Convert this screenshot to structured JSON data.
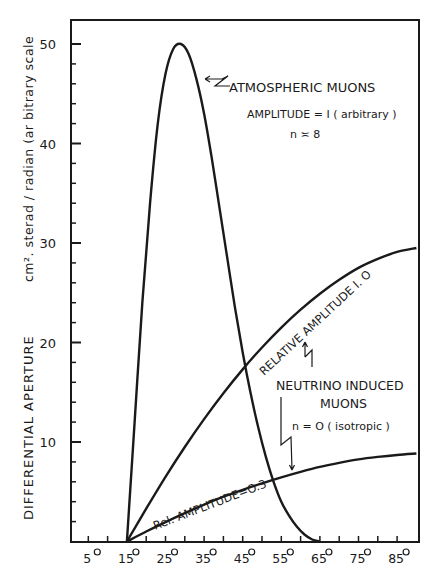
{
  "chart_data": {
    "type": "line",
    "title": "",
    "xlabel": "",
    "ylabel": "DIFFERENTIAL APERTURE   cm². sterad / radian (arbitrary scale",
    "ylabel_main": "DIFFERENTIAL  APERTURE",
    "ylabel_units": "cm². sterad / radian (arbitrary scale",
    "xlim": [
      0,
      90
    ],
    "ylim": [
      0,
      52
    ],
    "grid": false,
    "x_ticks": [
      5,
      15,
      25,
      35,
      45,
      55,
      65,
      75,
      85
    ],
    "x_tick_labels": [
      "5°",
      "15°",
      "25°",
      "35°",
      "45°",
      "55°",
      "65°",
      "75°",
      "85°"
    ],
    "y_ticks": [
      10,
      20,
      30,
      40,
      50
    ],
    "y_tick_labels": [
      "10",
      "20",
      "30",
      "40",
      "50"
    ],
    "series": [
      {
        "name": "Atmospheric muons (amplitude = 1, n ≈ 8)",
        "x": [
          15,
          17,
          19,
          21,
          23,
          25,
          27,
          29,
          31,
          33,
          35,
          37,
          39,
          41,
          43,
          45,
          47,
          49,
          51,
          53,
          55,
          57,
          59,
          61,
          63,
          65
        ],
        "y": [
          0,
          12,
          24,
          34,
          42,
          47,
          49.5,
          50,
          49,
          46.5,
          43,
          38.5,
          33.5,
          28.5,
          23.5,
          19,
          15,
          11.5,
          8.5,
          6,
          4,
          2.6,
          1.5,
          0.7,
          0.2,
          0
        ]
      },
      {
        "name": "Neutrino induced muons, relative amplitude 1.0 (n = 0, isotropic)",
        "x": [
          15,
          20,
          25,
          30,
          35,
          40,
          45,
          50,
          55,
          60,
          65,
          70,
          75,
          80,
          85,
          90
        ],
        "y": [
          0,
          3.3,
          6.5,
          9.5,
          12.3,
          14.9,
          17.3,
          19.5,
          21.5,
          23.3,
          24.9,
          26.3,
          27.5,
          28.4,
          29.1,
          29.5
        ]
      },
      {
        "name": "Neutrino induced muons, relative amplitude 0.3",
        "x": [
          15,
          20,
          25,
          30,
          35,
          40,
          45,
          50,
          55,
          60,
          65,
          70,
          75,
          80,
          85,
          90
        ],
        "y": [
          0,
          1.0,
          1.95,
          2.85,
          3.7,
          4.5,
          5.2,
          5.85,
          6.45,
          7.0,
          7.5,
          7.9,
          8.25,
          8.5,
          8.7,
          8.85
        ]
      }
    ],
    "annotations": [
      {
        "text": "ATMOSPHERIC MUONS",
        "target": "Atmospheric muons peak"
      },
      {
        "text": "AMPLITUDE = 1 (arbitrary)"
      },
      {
        "text": "n ≈ 8"
      },
      {
        "text": "RELATIVE AMPLITUDE 1.0"
      },
      {
        "text": "NEUTRINO INDUCED"
      },
      {
        "text": "MUONS"
      },
      {
        "text": "n = O (isotropic)"
      },
      {
        "text": "Rel. AMPLITUDE=0.3"
      }
    ]
  },
  "labels": {
    "atm_title": "ATMOSPHERIC  MUONS",
    "atm_amp": "AMPLITUDE = I ( arbitrary )",
    "atm_n": "n ≍ 8",
    "rel10": "RELATIVE   AMPLITUDE   I. O",
    "nu_line1": "NEUTRINO  INDUCED",
    "nu_line2": "MUONS",
    "nu_n": "n = O ( isotropic )",
    "rel03": "Rel. AMPLITUDE=O.3",
    "ylabel_main": "DIFFERENTIAL   APERTURE",
    "ylabel_units": "cm². sterad / radian (ar bitrary  scale"
  }
}
